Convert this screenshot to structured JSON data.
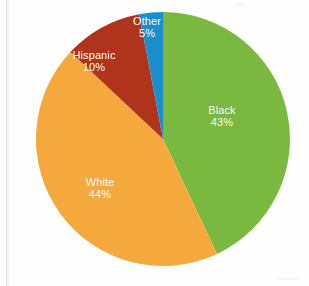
{
  "chart_data": {
    "type": "pie",
    "title": "",
    "subtitle": "",
    "xlabel": "",
    "ylabel": "",
    "legend_position": "none",
    "grid": false,
    "labels_inside_slices": true,
    "categories": [
      "Black",
      "White",
      "Hispanic",
      "Other"
    ],
    "values": [
      43,
      44,
      10,
      5
    ],
    "value_unit": "%",
    "slices": [
      {
        "label": "Black",
        "value": 43,
        "value_text": "43%",
        "color": "#7AB93F",
        "start_angle_deg": 0,
        "end_angle_deg": 154.8
      },
      {
        "label": "White",
        "value": 44,
        "value_text": "44%",
        "color": "#F5A93C",
        "start_angle_deg": 154.8,
        "end_angle_deg": 313.2
      },
      {
        "label": "Hispanic",
        "value": 10,
        "value_text": "10%",
        "color": "#B0331C",
        "start_angle_deg": 313.2,
        "end_angle_deg": 349.2
      },
      {
        "label": "Other",
        "value": 5,
        "value_text": "5%",
        "color": "#1B8FCB",
        "start_angle_deg": 349.2,
        "end_angle_deg": 360
      }
    ],
    "total": 102
  },
  "colors": {
    "black_slice": "#7AB93F",
    "white_slice": "#F5A93C",
    "hispanic_slice": "#B0331C",
    "other_slice": "#1B8FCB",
    "label_text": "#FFFFFF",
    "background": "#FEFEFE"
  }
}
